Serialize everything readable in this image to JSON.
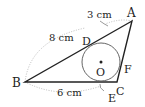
{
  "diagram": {
    "type": "triangle-with-incircle",
    "points": {
      "A": {
        "label": "A",
        "x": 132,
        "y": 21
      },
      "B": {
        "label": "B",
        "x": 25,
        "y": 82
      },
      "C": {
        "label": "C",
        "x": 117,
        "y": 82
      },
      "D": {
        "label": "D",
        "x": 90,
        "y": 44
      },
      "E": {
        "label": "E",
        "x": 101,
        "y": 82
      },
      "F": {
        "label": "F",
        "x": 123,
        "y": 58
      },
      "O": {
        "label": "O",
        "x": 101,
        "y": 62
      }
    },
    "circle": {
      "center": "O",
      "radius": 19
    },
    "measurements": {
      "AD": "3 cm",
      "BD": "8 cm",
      "BE": "6 cm"
    },
    "colors": {
      "line": "#222222",
      "circle": "#555555",
      "dotted": "#aaaaaa"
    }
  }
}
